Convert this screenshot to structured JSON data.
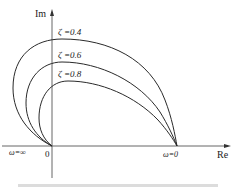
{
  "diagram": {
    "type": "nyquist-plot",
    "axes": {
      "y_label": "Im",
      "x_label": "Re",
      "origin_label": "0"
    },
    "annotations": {
      "omega_infinity": "ω=∞",
      "omega_zero": "ω=0"
    },
    "curves": [
      {
        "name": "zeta-0.4",
        "label": "ζ =0.4",
        "zeta": 0.4
      },
      {
        "name": "zeta-0.6",
        "label": "ζ =0.6",
        "zeta": 0.6
      },
      {
        "name": "zeta-0.8",
        "label": "ζ =0.8",
        "zeta": 0.8
      }
    ],
    "colors": {
      "line": "#2a2a2a",
      "axis": "#555555",
      "background": "#ffffff"
    }
  }
}
